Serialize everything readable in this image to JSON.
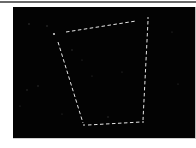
{
  "viewer": {
    "background_color": "#030303",
    "frame_color": "#6a6a6a"
  },
  "crop_outline": {
    "style": "dashed",
    "color": "#e8e8e8",
    "vertices": [
      {
        "name": "top-left",
        "x": 66,
        "y": 32
      },
      {
        "name": "top-right",
        "x": 148,
        "y": 19
      },
      {
        "name": "bottom-right",
        "x": 143,
        "y": 122
      },
      {
        "name": "bottom-left",
        "x": 85,
        "y": 125
      }
    ],
    "left_edge_start": {
      "x": 58,
      "y": 42
    }
  }
}
